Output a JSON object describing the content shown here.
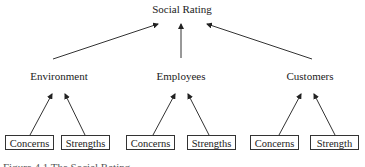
{
  "root": {
    "label": "Social Rating"
  },
  "categories": [
    {
      "label": "Environment",
      "children": [
        "Concerns",
        "Strengths"
      ]
    },
    {
      "label": "Employees",
      "children": [
        "Concerns",
        "Strengths"
      ]
    },
    {
      "label": "Customers",
      "children": [
        "Concerns",
        "Strength"
      ]
    }
  ],
  "caption": "Figure 4.1 The Social Rating"
}
